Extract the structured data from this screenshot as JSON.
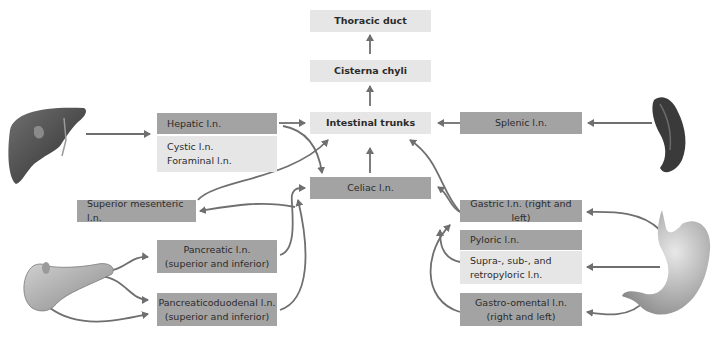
{
  "nodes": {
    "thoracic_duct": "Thoracic duct",
    "cisterna_chyli": "Cisterna chyli",
    "intestinal_trunks": "Intestinal trunks",
    "hepatic": "Hepatic l.n.",
    "cystic": "Cystic l.n.",
    "foraminal": "Foraminal l.n.",
    "celiac": "Celiac l.n.",
    "splenic": "Splenic l.n.",
    "superior_mesenteric": "Superior mesenteric l.n.",
    "pancreatic_line1": "Pancreatic l.n.",
    "pancreatic_line2": "(superior and inferior)",
    "pancreaticoduodenal_line1": "Pancreaticoduodenal l.n.",
    "pancreaticoduodenal_line2": "(superior and inferior)",
    "gastric": "Gastric l.n. (right and left)",
    "pyloric": "Pyloric l.n.",
    "suprapyloric_line1": "Supra-, sub-, and",
    "suprapyloric_line2": "retropyloric l.n.",
    "gastroomental_line1": "Gastro-omental l.n.",
    "gastroomental_line2": "(right and left)"
  },
  "organs": [
    "liver",
    "spleen",
    "pancreas",
    "stomach"
  ],
  "colors": {
    "dark_box": "#a3a3a3",
    "light_box": "#e6e6e6",
    "arrow": "#6f6f6f"
  }
}
